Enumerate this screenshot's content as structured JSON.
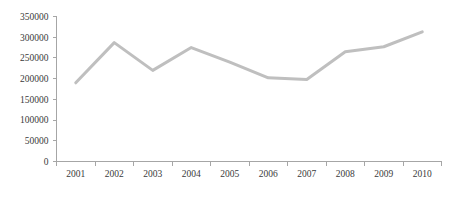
{
  "chart_data": {
    "type": "line",
    "title": "",
    "subtitle": "",
    "xlabel": "",
    "ylabel": "",
    "categories": [
      "2001",
      "2002",
      "2003",
      "2004",
      "2005",
      "2006",
      "2007",
      "2008",
      "2009",
      "2010"
    ],
    "values": [
      190000,
      287000,
      220000,
      275000,
      240000,
      202000,
      198000,
      265000,
      277000,
      313000
    ],
    "series": [
      {
        "name": "",
        "values": [
          190000,
          287000,
          220000,
          275000,
          240000,
          202000,
          198000,
          265000,
          277000,
          313000
        ]
      }
    ],
    "ylim": [
      0,
      350000
    ],
    "y_ticks": [
      0,
      50000,
      100000,
      150000,
      200000,
      250000,
      300000,
      350000
    ],
    "y_tick_labels": [
      "0",
      "50000",
      "100000",
      "150000",
      "200000",
      "250000",
      "300000",
      "350000"
    ],
    "x_tick_labels": [
      "2001",
      "2002",
      "2003",
      "2004",
      "2005",
      "2006",
      "2007",
      "2008",
      "2009",
      "2010"
    ],
    "grid": false,
    "legend": false,
    "legend_position": "none",
    "line_color": "#BFBFBF",
    "axis_color": "#A6A6A6",
    "text_color": "#3A3A3A",
    "background_color": "#FFFFFF",
    "line_width": 3
  }
}
